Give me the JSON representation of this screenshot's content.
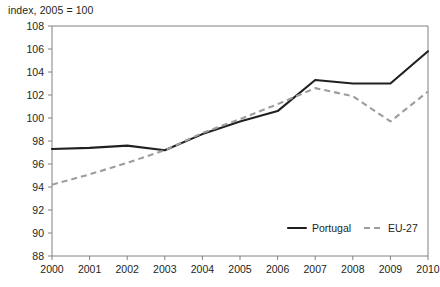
{
  "chart_data": {
    "type": "line",
    "title": "index, 2005 = 100",
    "xlabel": "",
    "ylabel": "",
    "x": [
      2000,
      2001,
      2002,
      2003,
      2004,
      2005,
      2006,
      2007,
      2008,
      2009,
      2010
    ],
    "categories": [
      "2000",
      "2001",
      "2002",
      "2003",
      "2004",
      "2005",
      "2006",
      "2007",
      "2008",
      "2009",
      "2010"
    ],
    "ylim": [
      88,
      108
    ],
    "yticks": [
      88,
      90,
      92,
      94,
      96,
      98,
      100,
      102,
      104,
      106,
      108
    ],
    "ytick_labels": [
      "88",
      "90",
      "92",
      "94",
      "96",
      "98",
      "100",
      "102",
      "104",
      "106",
      "108"
    ],
    "grid": false,
    "legend_position": "bottom-right",
    "series": [
      {
        "name": "Portugal",
        "style": "solid",
        "color": "#231f20",
        "values": [
          97.3,
          97.4,
          97.6,
          97.2,
          98.6,
          99.7,
          100.6,
          103.3,
          103.0,
          103.0,
          105.8
        ]
      },
      {
        "name": "EU-27",
        "style": "dashed",
        "color": "#9d9d9d",
        "values": [
          94.2,
          95.1,
          96.1,
          97.2,
          98.7,
          99.9,
          101.2,
          102.6,
          101.9,
          99.7,
          102.3
        ]
      }
    ]
  },
  "legend": {
    "items": [
      {
        "label": "Portugal"
      },
      {
        "label": "EU-27"
      }
    ]
  }
}
